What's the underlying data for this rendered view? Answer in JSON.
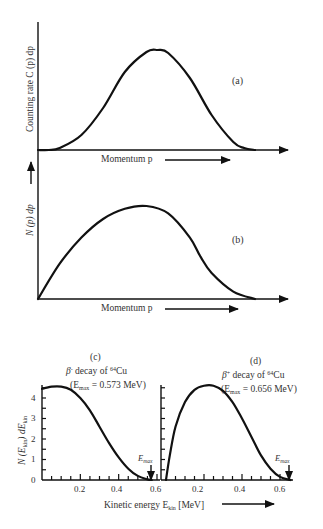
{
  "chart_data": [
    {
      "id": "a",
      "type": "line",
      "panel_label": "(a)",
      "ylabel": "Counting rate C (p) dp",
      "xlabel": "Momentum p",
      "grid": false,
      "description": "Bell-shaped momentum spectrum (counting rate vs momentum)",
      "x": [
        0,
        0.05,
        0.1,
        0.2,
        0.3,
        0.4,
        0.5,
        0.55,
        0.6,
        0.7,
        0.8,
        0.9,
        0.95,
        1.0
      ],
      "y": [
        0,
        0,
        0.02,
        0.15,
        0.42,
        0.78,
        0.98,
        1.0,
        0.97,
        0.72,
        0.35,
        0.08,
        0.02,
        0
      ]
    },
    {
      "id": "b",
      "type": "line",
      "panel_label": "(b)",
      "ylabel": "N (p) dp",
      "xlabel": "Momentum p",
      "grid": false,
      "description": "Momentum distribution rising from origin, peaking near middle, tailing to zero",
      "x": [
        0,
        0.1,
        0.2,
        0.3,
        0.4,
        0.5,
        0.6,
        0.7,
        0.75,
        0.8,
        0.9,
        1.0
      ],
      "y": [
        0,
        0.38,
        0.66,
        0.86,
        0.97,
        1.0,
        0.92,
        0.66,
        0.45,
        0.28,
        0.08,
        0
      ]
    },
    {
      "id": "c",
      "type": "line",
      "panel_label": "(c)",
      "title": "β⁻ decay of ⁶⁴Cu",
      "subtitle": "(E_max = 0.573 MeV)",
      "ylabel": "N (E_kin) dE_kin",
      "xlabel": "Kinetic energy E_kin [MeV]",
      "annotation": "E_max",
      "x_ticks": [
        0.2,
        0.4,
        0.6
      ],
      "y_ticks": [
        0,
        1,
        2,
        3,
        4
      ],
      "xlim": [
        0,
        0.62
      ],
      "ylim": [
        0,
        4.8
      ],
      "grid": false,
      "x": [
        0.0,
        0.05,
        0.1,
        0.15,
        0.2,
        0.25,
        0.3,
        0.35,
        0.4,
        0.45,
        0.5,
        0.55,
        0.573
      ],
      "y": [
        4.45,
        4.55,
        4.55,
        4.4,
        4.0,
        3.4,
        2.6,
        1.8,
        1.1,
        0.55,
        0.2,
        0.03,
        0
      ]
    },
    {
      "id": "d",
      "type": "line",
      "panel_label": "(d)",
      "title": "β⁺ decay of ⁶⁴Cu",
      "subtitle": "(E_max = 0.656 MeV)",
      "xlabel": "Kinetic energy E_kin [MeV]",
      "annotation": "E_max",
      "x_ticks": [
        0.2,
        0.4,
        0.6
      ],
      "xlim": [
        0,
        0.68
      ],
      "ylim": [
        0,
        4.8
      ],
      "grid": false,
      "x": [
        0.0,
        0.02,
        0.05,
        0.1,
        0.15,
        0.2,
        0.25,
        0.3,
        0.35,
        0.4,
        0.45,
        0.5,
        0.55,
        0.6,
        0.656
      ],
      "y": [
        0,
        1.2,
        2.6,
        3.8,
        4.4,
        4.6,
        4.6,
        4.35,
        3.8,
        3.0,
        2.1,
        1.2,
        0.55,
        0.15,
        0
      ]
    }
  ],
  "labels": {
    "a": {
      "panel": "(a)",
      "ylabel": "Counting rate C (p) dp",
      "xlabel": "Momentum p"
    },
    "b": {
      "panel": "(b)",
      "ylabel": "N (p) dp",
      "xlabel": "Momentum p"
    },
    "c": {
      "panel": "(c)",
      "title_beta": "β",
      "title_sign": "-",
      "title_rest": " decay of ",
      "title_iso_mass": "64",
      "title_iso": "Cu",
      "sub_open": "(E",
      "sub_max": "max",
      "sub_val": " = 0.573 MeV)",
      "emax": "E",
      "emax_sub": "max"
    },
    "d": {
      "panel": "(d)",
      "title_beta": "β",
      "title_sign": "+",
      "title_rest": " decay of ",
      "title_iso_mass": "64",
      "title_iso": "Cu",
      "sub_open": "(E",
      "sub_max": "max",
      "sub_val": " = 0.656 MeV)",
      "emax": "E",
      "emax_sub": "max"
    },
    "energy_ylabel": "N (E",
    "energy_ylabel_sub": "kin",
    "energy_ylabel_rest": ") dE",
    "energy_ylabel_sub2": "kin",
    "energy_xlabel": "Kinetic energy E",
    "energy_xlabel_sub": "kin",
    "energy_xlabel_rest": " [MeV]",
    "y_ticks": [
      "0",
      "1",
      "2",
      "3",
      "4"
    ],
    "x_ticks": [
      "0.2",
      "0.4",
      "0.6"
    ]
  }
}
